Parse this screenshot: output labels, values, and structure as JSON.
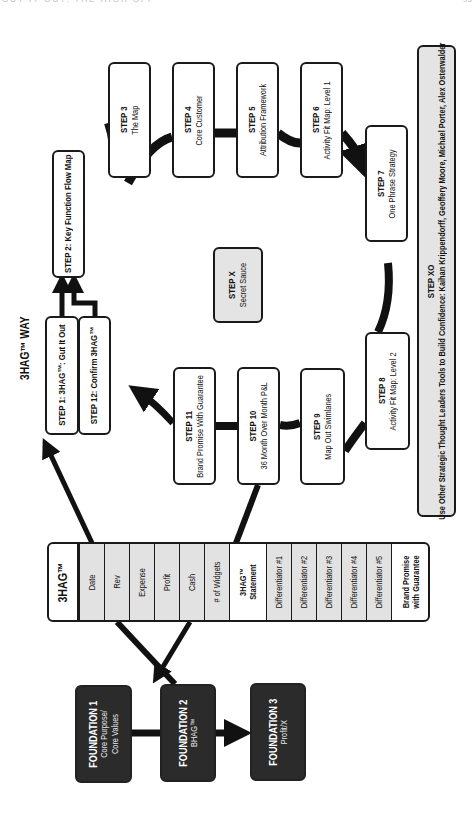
{
  "page_header": {
    "running_title": "GUT IT OUT: THE HIGH OFF",
    "page_number": "93"
  },
  "diagram": {
    "title": "3HAG™ WAY",
    "steps": {
      "step1": {
        "label": "STEP 1: 3HAG™: Gut It Out"
      },
      "step12": {
        "label": "STEP 12: Confirm 3HAG™"
      },
      "step2": {
        "label": "STEP 2: Key Function Flow Map"
      },
      "step3": {
        "title": "STEP 3",
        "subtitle": "The Map"
      },
      "step4": {
        "title": "STEP 4",
        "subtitle": "Core Customer"
      },
      "step5": {
        "title": "STEP 5",
        "subtitle": "Attribution Framework"
      },
      "step6": {
        "title": "STEP 6",
        "subtitle": "Activity Fit Map: Level 1"
      },
      "step7": {
        "title": "STEP 7",
        "subtitle": "One Phrase Strategy"
      },
      "step8": {
        "title": "STEP 8",
        "subtitle": "Activity Fit Map: Level 2"
      },
      "step9": {
        "title": "STEP 9",
        "subtitle": "Map Out Swimlanes"
      },
      "step10": {
        "title": "STEP 10",
        "subtitle": "36 Month Over Month P&L"
      },
      "step11": {
        "title": "STEP 11",
        "subtitle": "Brand Promise With Guarantee"
      },
      "stepx": {
        "title": "STEP X",
        "subtitle": "Secret Sauce"
      },
      "stepxo": {
        "title": "STEP XO",
        "subtitle": "Use Other Strategic Thought Leaders Tools to Build Confidence:  Kaihan Krippendorff, Geoffery Moore, Michael Porter, Alex Osterwalder"
      }
    },
    "table_3hag": {
      "header": "3HAG™",
      "rows": [
        {
          "label": "Date",
          "style": "gray"
        },
        {
          "label": "Rev",
          "style": "gray"
        },
        {
          "label": "Expense",
          "style": "gray"
        },
        {
          "label": "Profit",
          "style": "gray"
        },
        {
          "label": "Cash",
          "style": "gray"
        },
        {
          "label": "# of Widgets",
          "style": "gray"
        },
        {
          "label": "3HAG™ Statement",
          "style": "bold"
        },
        {
          "label": "Differentiator #1",
          "style": "gray"
        },
        {
          "label": "Differentiator #2",
          "style": "gray"
        },
        {
          "label": "Differentiator #3",
          "style": "gray"
        },
        {
          "label": "Differentiator #4",
          "style": "gray"
        },
        {
          "label": "Differentiator #5",
          "style": "gray"
        },
        {
          "label": "Brand Promise with Guarantee",
          "style": "bold"
        }
      ]
    },
    "foundations": [
      {
        "title": "FOUNDATION 1",
        "subtitle": "Core Purpose/ Core Values"
      },
      {
        "title": "FOUNDATION 2",
        "subtitle": "BHAG™"
      },
      {
        "title": "FOUNDATION 3",
        "subtitle": "Profit/X"
      }
    ],
    "colors": {
      "line": "#111111",
      "box_border": "#1a1a1a",
      "gray_fill": "#e4e4e4",
      "dark_fill": "#2b2b2b"
    }
  }
}
